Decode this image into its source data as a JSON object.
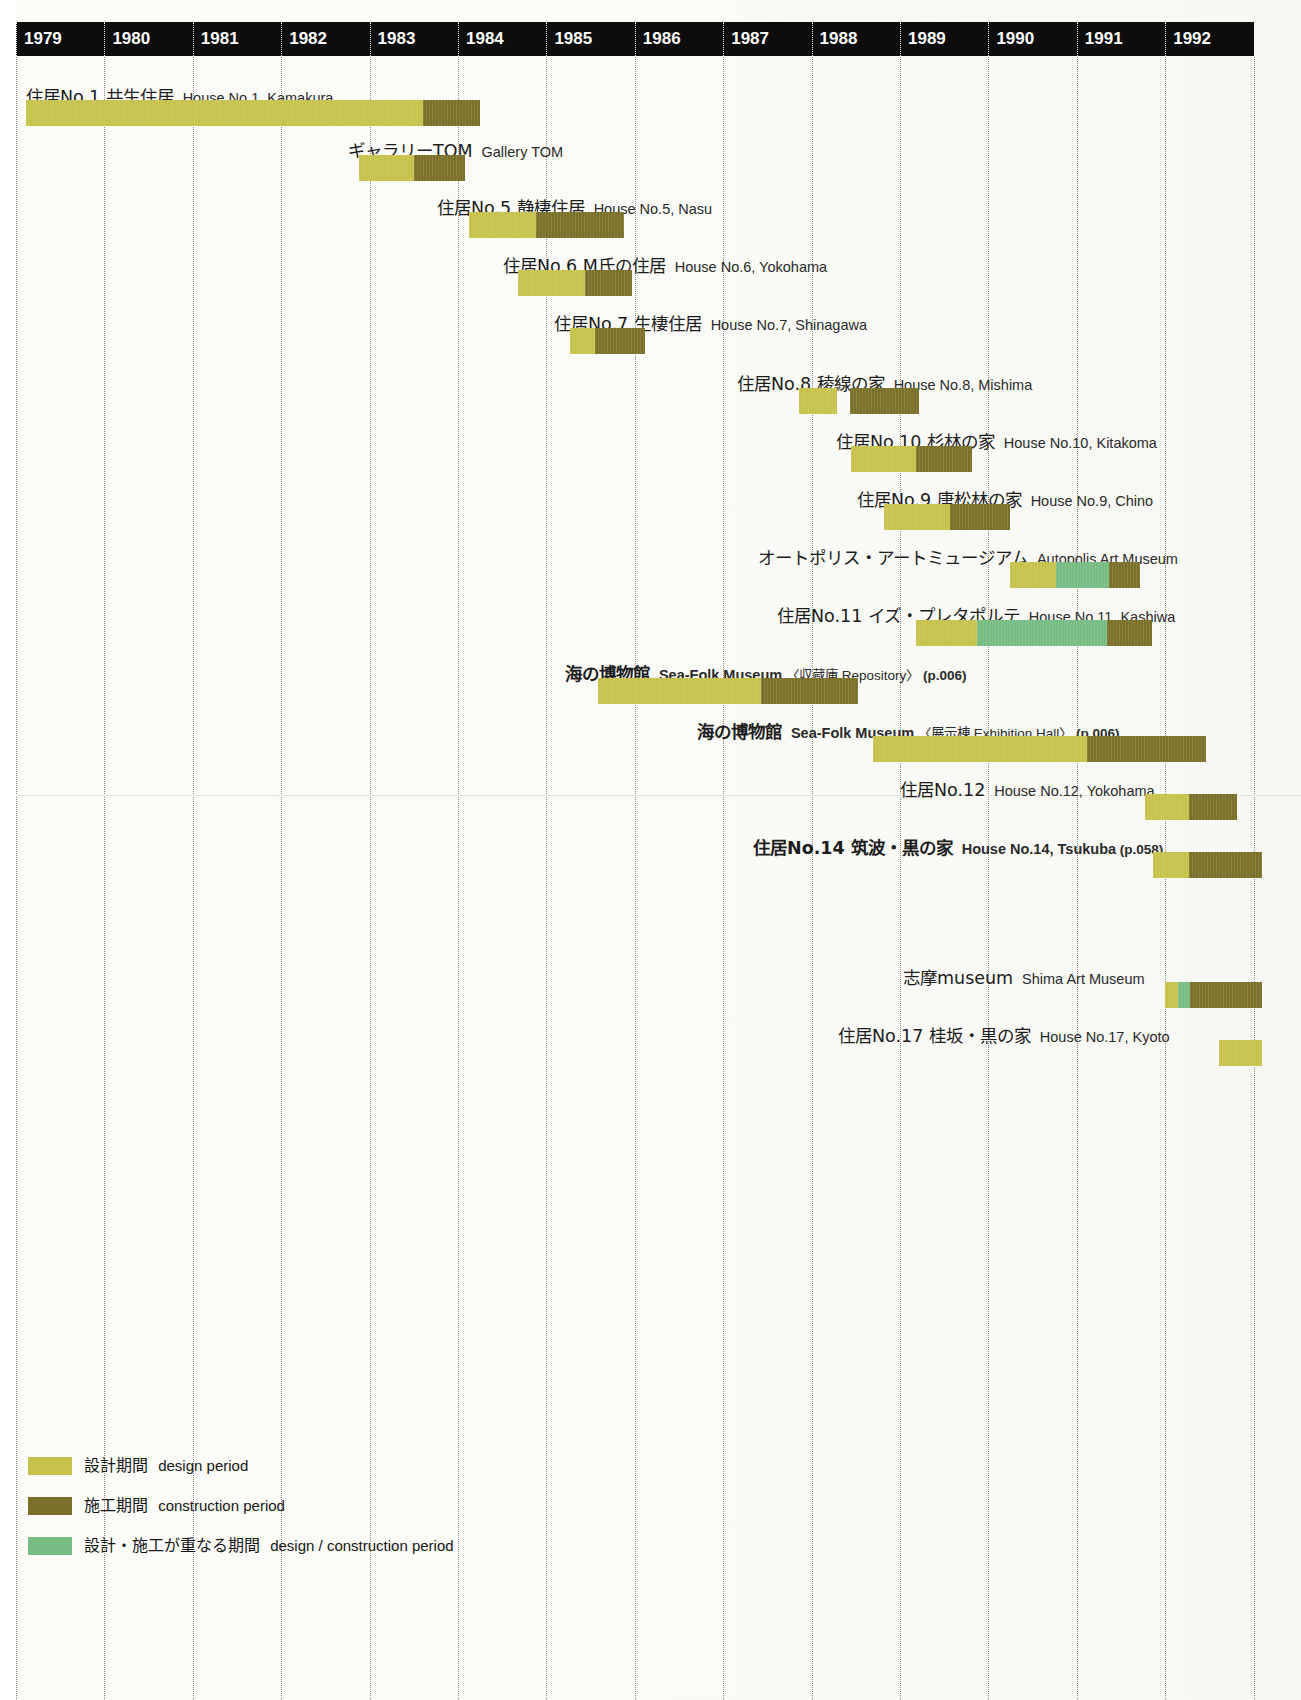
{
  "chart_data": {
    "type": "bar",
    "subtype": "gantt",
    "title": "",
    "xlabel": "",
    "ylabel": "",
    "axis": {
      "years": [
        "1979",
        "1980",
        "1981",
        "1982",
        "1983",
        "1984",
        "1985",
        "1986",
        "1987",
        "1988",
        "1989",
        "1990",
        "1991",
        "1992"
      ],
      "year_start": 1979,
      "year_end": 1993,
      "grid": "dotted vertical year gridlines"
    },
    "colors": {
      "design": "#c6c24b",
      "construction": "#7b7029",
      "overlap": "#77bd83",
      "header_band": "#0d0d0d",
      "page": "#fbfbf8"
    },
    "legend": {
      "position": "bottom-left",
      "entries": [
        {
          "swatch": "design",
          "ja": "設計期間",
          "en": "design period"
        },
        {
          "swatch": "construction",
          "ja": "施工期間",
          "en": "construction period"
        },
        {
          "swatch": "overlap",
          "ja": "設計・施工が重なる期間",
          "en": "design / construction period"
        }
      ]
    },
    "tasks": [
      {
        "ja": "住居No.1 共生住居",
        "en": "House No.1, Kamakura",
        "note": "",
        "page_ref": "",
        "bold": false,
        "label_x": 26,
        "label_y": 89,
        "bar_y": 100,
        "segments": [
          {
            "kind": "design",
            "start": 1979.11,
            "end": 1983.6
          },
          {
            "kind": "construction",
            "start": 1983.6,
            "end": 1984.25
          }
        ]
      },
      {
        "ja": "ギャラリーTOM",
        "en": "Gallery TOM",
        "note": "",
        "page_ref": "",
        "bold": false,
        "label_x": 348,
        "label_y": 143,
        "bar_y": 155,
        "segments": [
          {
            "kind": "design",
            "start": 1982.88,
            "end": 1983.5
          },
          {
            "kind": "construction",
            "start": 1983.5,
            "end": 1984.08
          }
        ]
      },
      {
        "ja": "住居No.5 静棲住居",
        "en": "House No.5, Nasu",
        "note": "",
        "page_ref": "",
        "bold": false,
        "label_x": 437,
        "label_y": 200,
        "bar_y": 212,
        "segments": [
          {
            "kind": "design",
            "start": 1984.12,
            "end": 1984.88
          },
          {
            "kind": "construction",
            "start": 1984.88,
            "end": 1985.88
          }
        ]
      },
      {
        "ja": "住居No.6 M氏の住居",
        "en": "House No.6, Yokohama",
        "note": "",
        "page_ref": "",
        "bold": false,
        "label_x": 503,
        "label_y": 258,
        "bar_y": 270,
        "segments": [
          {
            "kind": "design",
            "start": 1984.68,
            "end": 1985.44
          },
          {
            "kind": "construction",
            "start": 1985.44,
            "end": 1985.97
          }
        ]
      },
      {
        "ja": "住居No.7 生棲住居",
        "en": "House No.7, Shinagawa",
        "note": "",
        "page_ref": "",
        "bold": false,
        "label_x": 554,
        "label_y": 316,
        "bar_y": 328,
        "segments": [
          {
            "kind": "design",
            "start": 1985.27,
            "end": 1985.55
          },
          {
            "kind": "construction",
            "start": 1985.55,
            "end": 1986.12
          }
        ]
      },
      {
        "ja": "住居No.8 稜線の家",
        "en": "House No.8, Mishima",
        "note": "",
        "page_ref": "",
        "bold": false,
        "label_x": 737,
        "label_y": 376,
        "bar_y": 388,
        "segments": [
          {
            "kind": "design",
            "start": 1987.86,
            "end": 1988.29
          },
          {
            "kind": "construction",
            "start": 1988.43,
            "end": 1989.22
          }
        ]
      },
      {
        "ja": "住居No.10 杉林の家",
        "en": "House No.10, Kitakoma",
        "note": "",
        "page_ref": "",
        "bold": false,
        "label_x": 836,
        "label_y": 434,
        "bar_y": 446,
        "segments": [
          {
            "kind": "design",
            "start": 1988.45,
            "end": 1989.18
          },
          {
            "kind": "construction",
            "start": 1989.18,
            "end": 1989.82
          }
        ]
      },
      {
        "ja": "住居No.9 唐松林の家",
        "en": "House No.9, Chino",
        "note": "",
        "page_ref": "",
        "bold": false,
        "label_x": 857,
        "label_y": 492,
        "bar_y": 504,
        "segments": [
          {
            "kind": "design",
            "start": 1988.82,
            "end": 1989.57
          },
          {
            "kind": "construction",
            "start": 1989.57,
            "end": 1990.24
          }
        ]
      },
      {
        "ja": "オートポリス・アートミュージアム",
        "en": "Autopolis Art Museum",
        "note": "",
        "page_ref": "",
        "bold": false,
        "label_x": 758,
        "label_y": 550,
        "bar_y": 562,
        "segments": [
          {
            "kind": "design",
            "start": 1990.24,
            "end": 1990.77
          },
          {
            "kind": "overlap",
            "start": 1990.77,
            "end": 1991.36
          },
          {
            "kind": "construction",
            "start": 1991.36,
            "end": 1991.71
          }
        ]
      },
      {
        "ja": "住居No.11 イズ・プレタポルテ",
        "en": "House No.11, Kashiwa",
        "note": "",
        "page_ref": "",
        "bold": false,
        "label_x": 777,
        "label_y": 608,
        "bar_y": 620,
        "segments": [
          {
            "kind": "design",
            "start": 1989.18,
            "end": 1989.87
          },
          {
            "kind": "overlap",
            "start": 1989.87,
            "end": 1991.34
          },
          {
            "kind": "construction",
            "start": 1991.34,
            "end": 1991.85
          }
        ]
      },
      {
        "ja": "海の博物館",
        "en": "Sea-Folk Museum",
        "note": "〈収蔵庫  Repository〉",
        "page_ref": "(p.006)",
        "bold": true,
        "label_x": 565,
        "label_y": 666,
        "bar_y": 678,
        "segments": [
          {
            "kind": "design",
            "start": 1985.58,
            "end": 1987.43
          },
          {
            "kind": "construction",
            "start": 1987.43,
            "end": 1988.52
          }
        ]
      },
      {
        "ja": "海の博物館",
        "en": "Sea-Folk Museum",
        "note": "〈展示棟  Exhibition Hall〉",
        "page_ref": "(p.006)",
        "bold": true,
        "label_x": 697,
        "label_y": 724,
        "bar_y": 736,
        "segments": [
          {
            "kind": "design",
            "start": 1988.7,
            "end": 1991.11
          },
          {
            "kind": "construction",
            "start": 1991.11,
            "end": 1992.46
          }
        ]
      },
      {
        "ja": "住居No.12",
        "en": "House No.12, Yokohama",
        "note": "",
        "page_ref": "",
        "bold": false,
        "label_x": 900,
        "label_y": 782,
        "bar_y": 794,
        "segments": [
          {
            "kind": "design",
            "start": 1991.77,
            "end": 1992.27
          },
          {
            "kind": "construction",
            "start": 1992.27,
            "end": 1992.81
          }
        ]
      },
      {
        "ja": "住居No.14 筑波・黒の家",
        "en": "House No.14, Tsukuba",
        "note": "",
        "page_ref": "(p.058)",
        "bold": true,
        "label_x": 753,
        "label_y": 840,
        "bar_y": 852,
        "segments": [
          {
            "kind": "design",
            "start": 1991.86,
            "end": 1992.27
          },
          {
            "kind": "construction",
            "start": 1992.27,
            "end": 1993.1
          }
        ]
      },
      {
        "ja": "志摩museum",
        "en": "Shima Art Museum",
        "note": "",
        "page_ref": "",
        "bold": false,
        "label_x": 903,
        "label_y": 970,
        "bar_y": 982,
        "segments": [
          {
            "kind": "design",
            "start": 1992.0,
            "end": 1992.14
          },
          {
            "kind": "overlap",
            "start": 1992.14,
            "end": 1992.28
          },
          {
            "kind": "construction",
            "start": 1992.28,
            "end": 1993.1
          }
        ]
      },
      {
        "ja": "住居No.17 桂坂・黒の家",
        "en": "House No.17, Kyoto",
        "note": "",
        "page_ref": "",
        "bold": false,
        "label_x": 838,
        "label_y": 1028,
        "bar_y": 1040,
        "segments": [
          {
            "kind": "design",
            "start": 1992.61,
            "end": 1993.1
          }
        ]
      }
    ]
  },
  "geometry": {
    "origin_x": 16,
    "year_width": 88.4,
    "bar_height": 26,
    "header_top": 22,
    "header_height": 34,
    "plot_right": 1301
  },
  "legend_block": {
    "left": 28,
    "top": 1455,
    "row_gap": 40
  }
}
